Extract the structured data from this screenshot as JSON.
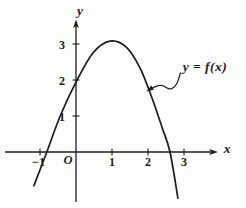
{
  "figure": {
    "paper_color": "#fdfdfb",
    "ink_color": "#1c1c1c",
    "axis": {
      "x_label": "x",
      "y_label": "y",
      "origin_label": "O"
    },
    "annotation": {
      "text": "y = f(x)"
    },
    "x_ticks": [
      {
        "value": -1,
        "label": "−1"
      },
      {
        "value": 1,
        "label": "1"
      },
      {
        "value": 2,
        "label": "2"
      },
      {
        "value": 3,
        "label": "3"
      }
    ],
    "y_ticks": [
      {
        "value": 1,
        "label": "1"
      },
      {
        "value": 2,
        "label": "2"
      },
      {
        "value": 3,
        "label": "3"
      }
    ]
  },
  "chart_data": {
    "type": "line",
    "title": "",
    "xlabel": "x",
    "ylabel": "y",
    "xlim": [
      -1.4,
      4.1
    ],
    "ylim": [
      -1.6,
      3.8
    ],
    "grid": false,
    "legend": "none",
    "annotations": [
      "y = f(x)"
    ],
    "shape_description": "Downward-opening parabolic curve: vertex near (1, 3), crosses y-axis at (0, 2), x-intercepts near x = -0.8 and x = 2.65",
    "key_points": {
      "vertex": [
        1,
        3.05
      ],
      "y_intercept": [
        0,
        2
      ],
      "x_intercepts": [
        -0.8,
        2.65
      ]
    },
    "series": [
      {
        "name": "y = f(x)",
        "points": [
          [
            -1.17,
            -0.94
          ],
          [
            -0.81,
            0.0
          ],
          [
            -0.44,
            1.0
          ],
          [
            0.0,
            1.94
          ],
          [
            0.47,
            2.75
          ],
          [
            0.94,
            3.08
          ],
          [
            1.39,
            2.92
          ],
          [
            1.78,
            2.33
          ],
          [
            2.11,
            1.5
          ],
          [
            2.39,
            0.69
          ],
          [
            2.61,
            0.0
          ],
          [
            2.83,
            -1.28
          ]
        ]
      }
    ]
  }
}
